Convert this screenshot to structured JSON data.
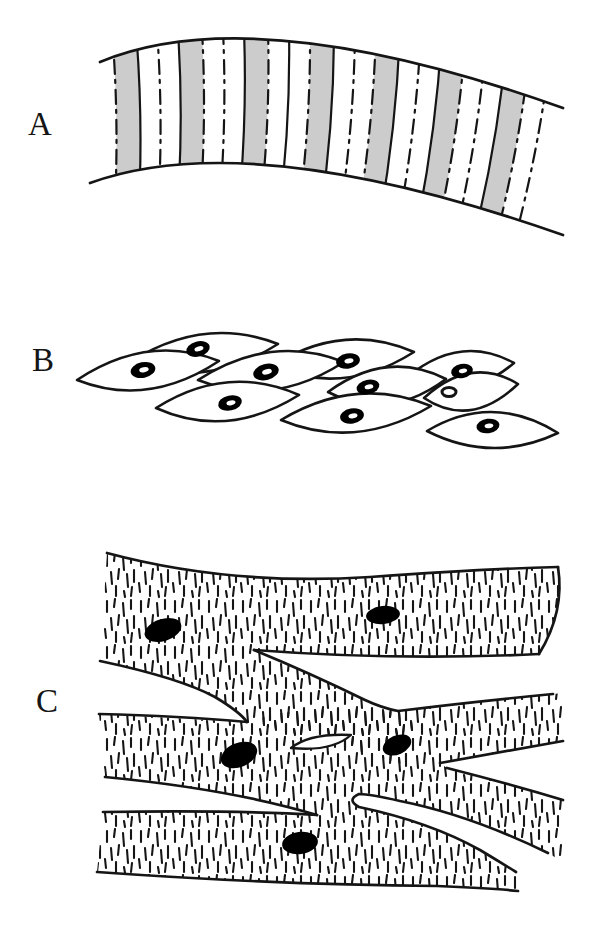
{
  "figure": {
    "title_present": false,
    "panels": [
      {
        "label": "A"
      },
      {
        "label": "B"
      },
      {
        "label": "C"
      }
    ],
    "colors": {
      "ink": "#151515",
      "stripe_gray": "#cccccc",
      "paper": "#ffffff",
      "nucleus": "#000000"
    }
  }
}
